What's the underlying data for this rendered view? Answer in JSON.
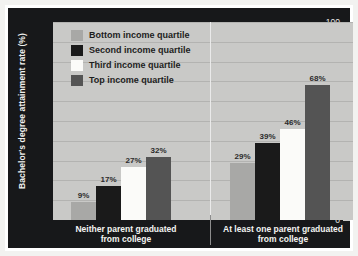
{
  "chart_data": {
    "type": "bar",
    "title": "",
    "xlabel": "",
    "ylabel": "Bachelor's degree attainment rate (%)",
    "ylim": [
      0,
      100
    ],
    "ytick_labels": [
      "100",
      "90",
      "80",
      "70",
      "60",
      "50",
      "40",
      "30",
      "20",
      "10",
      "0"
    ],
    "ytick_values": [
      100,
      90,
      80,
      70,
      60,
      50,
      40,
      30,
      20,
      10,
      0
    ],
    "grid": true,
    "legend_position": "top-left",
    "categories": [
      "Neither parent graduated from college",
      "At least one parent graduated from college"
    ],
    "category_lines": [
      [
        "Neither parent graduated",
        "from college"
      ],
      [
        "At least one parent graduated",
        "from college"
      ]
    ],
    "series": [
      {
        "name": "Bottom income quartile",
        "color": "#a8a8a6",
        "values": [
          9,
          29
        ],
        "labels": [
          "9%",
          "29%"
        ]
      },
      {
        "name": "Second income quartile",
        "color": "#1a1a1a",
        "values": [
          17,
          39
        ],
        "labels": [
          "17%",
          "39%"
        ]
      },
      {
        "name": "Third income quartile",
        "color": "#fbfbf9",
        "values": [
          27,
          46
        ],
        "labels": [
          "27%",
          "46%"
        ]
      },
      {
        "name": "Top income quartile",
        "color": "#545454",
        "values": [
          32,
          68
        ],
        "labels": [
          "32%",
          "68%"
        ]
      }
    ]
  },
  "colors": {
    "panel": "#17181a",
    "plot_background": "#c9c9c7",
    "gridline": "#b3b3b1",
    "axis_text": "#e9e9e7",
    "outer_frame": "#ffffff"
  }
}
